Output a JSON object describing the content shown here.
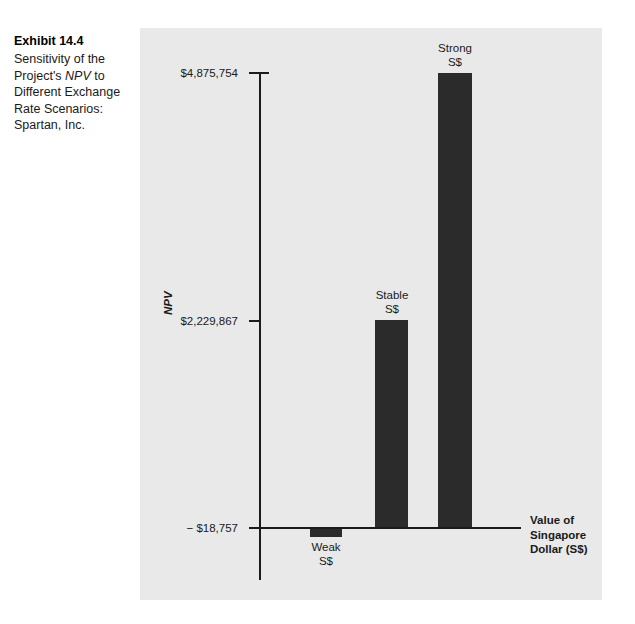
{
  "caption": {
    "exhibit_label": "Exhibit 14.4",
    "description_pre": "Sensitivity of the Project's ",
    "description_italic": "NPV",
    "description_post": " to Different Exchange Rate Scenarios: Spartan, Inc."
  },
  "axis": {
    "y_title": "NPV",
    "x_title_line1": "Value of",
    "x_title_line2": "Singapore",
    "x_title_line3": "Dollar (S$)"
  },
  "colors": {
    "bar": "#2b2b2b",
    "panel_background": "#e9e9e9",
    "axis": "#1b1b1b",
    "text": "#1a1a1a"
  },
  "chart_data": {
    "type": "bar",
    "title": "Sensitivity of the Project's NPV to Different Exchange Rate Scenarios: Spartan, Inc.",
    "xlabel": "Value of Singapore Dollar (S$)",
    "ylabel": "NPV",
    "categories": [
      "Weak S$",
      "Stable S$",
      "Strong S$"
    ],
    "category_labels": [
      {
        "line1": "Weak",
        "line2": "S$"
      },
      {
        "line1": "Stable",
        "line2": "S$"
      },
      {
        "line1": "Strong",
        "line2": "S$"
      }
    ],
    "values": [
      -18757,
      2229867,
      4875754
    ],
    "value_labels": [
      "− $18,757",
      "$2,229,867",
      "$4,875,754"
    ],
    "ytick_values": [
      -18757,
      2229867,
      4875754
    ],
    "ytick_labels": [
      "− $18,757",
      "$2,229,867",
      "$4,875,754"
    ],
    "ylim": [
      -18757,
      4875754
    ],
    "grid": false,
    "legend": false,
    "bar_color": "#2b2b2b"
  }
}
